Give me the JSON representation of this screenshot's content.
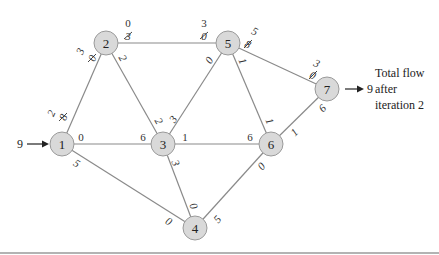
{
  "diagram": {
    "nodes": [
      {
        "id": "1",
        "label": "1",
        "x": 62,
        "y": 144
      },
      {
        "id": "2",
        "label": "2",
        "x": 106,
        "y": 43
      },
      {
        "id": "3",
        "label": "3",
        "x": 163,
        "y": 144
      },
      {
        "id": "4",
        "label": "4",
        "x": 195,
        "y": 228
      },
      {
        "id": "5",
        "label": "5",
        "x": 228,
        "y": 43
      },
      {
        "id": "6",
        "label": "6",
        "x": 271,
        "y": 144
      },
      {
        "id": "7",
        "label": "7",
        "x": 327,
        "y": 89
      }
    ],
    "edges": [
      {
        "from": "1",
        "to": "2",
        "from_residual": "2",
        "from_residual_old": "8",
        "to_residual": "3",
        "to_residual_old": "0"
      },
      {
        "from": "1",
        "to": "3",
        "from_residual": "0",
        "to_residual": "6"
      },
      {
        "from": "1",
        "to": "4",
        "from_residual": "5",
        "to_residual": "0"
      },
      {
        "from": "2",
        "to": "3",
        "from_residual": "2",
        "to_residual": "2"
      },
      {
        "from": "2",
        "to": "5",
        "from_residual": "0",
        "from_residual_old": "3",
        "to_residual": "3",
        "to_residual_old": "0"
      },
      {
        "from": "3",
        "to": "4",
        "from_residual": "3",
        "to_residual": "0"
      },
      {
        "from": "3",
        "to": "5",
        "from_residual": "3",
        "to_residual": "0"
      },
      {
        "from": "3",
        "to": "6",
        "from_residual": "1",
        "to_residual": "6"
      },
      {
        "from": "4",
        "to": "6",
        "from_residual": "5",
        "to_residual": "0"
      },
      {
        "from": "5",
        "to": "6",
        "from_residual": "1",
        "to_residual": "1"
      },
      {
        "from": "5",
        "to": "7",
        "from_residual": "5",
        "from_residual_old": "8",
        "to_residual": "3",
        "to_residual_old": "0"
      },
      {
        "from": "6",
        "to": "7",
        "from_residual": "1",
        "to_residual": "6"
      }
    ],
    "source_inflow": "9",
    "sink_outflow": "9",
    "annotation": {
      "line1": "Total flow",
      "line2": "after",
      "line3": "iteration 2"
    }
  }
}
